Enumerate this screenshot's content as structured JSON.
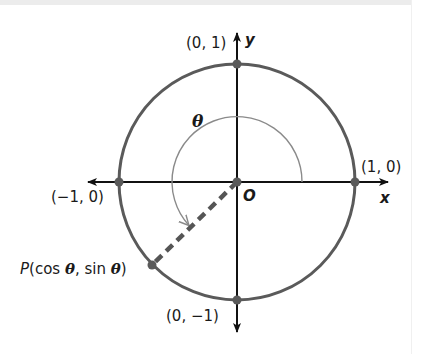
{
  "figure": {
    "axes": {
      "x_label": "x",
      "y_label": "y",
      "origin_label": "O"
    },
    "points": {
      "top": "(0, 1)",
      "right": "(1, 0)",
      "left": "(−1, 0)",
      "bottom": "(0, −1)"
    },
    "angle_label": "θ",
    "point_p": {
      "name": "P",
      "coords_open": "(cos ",
      "theta1": "θ",
      "coords_mid": ", sin ",
      "theta2": "θ",
      "coords_close": ")"
    },
    "colors": {
      "circle": "#5a5a5a",
      "axes": "#111111",
      "angle_arc": "#8a8a8a",
      "dashed_radius": "#555555",
      "points": "#5a5a5a"
    }
  }
}
